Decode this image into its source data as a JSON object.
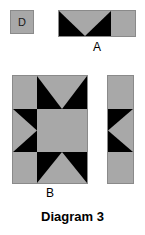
{
  "diagram": {
    "caption": "Diagram 3",
    "background_color": "#ffffff",
    "fabric_gray": "#a8a8a8",
    "fabric_black": "#000000",
    "outline_color": "#8a8a8a"
  },
  "pieces": {
    "d": {
      "label": "D",
      "shape": "square",
      "description": "plain gray square patch",
      "x": 10,
      "y": 10,
      "width": 24,
      "height": 24
    },
    "a": {
      "label": "A",
      "shape": "horizontal-strip",
      "description": "flying-geese unit pointing down joined to a plain gray square",
      "x": 58,
      "y": 10,
      "width": 78,
      "height": 27,
      "units": [
        {
          "name": "flying-geese-down",
          "triangle_direction": "down",
          "ground": "black",
          "triangle": "gray"
        },
        {
          "name": "plain-square",
          "fill": "gray"
        }
      ]
    },
    "b": {
      "label": "B",
      "shape": "star-block",
      "description": "three by three star block with gray corners, gray center and four flying-geese units pointing inward",
      "x": 12,
      "y": 75,
      "width": 76,
      "height": 109,
      "grid": [
        [
          "gray-square",
          "flying-geese-down",
          "gray-square"
        ],
        [
          "flying-geese-right",
          "gray-square-center",
          "black-square"
        ],
        [
          "gray-square",
          "flying-geese-up",
          "gray-square"
        ]
      ]
    },
    "c": {
      "label": "",
      "shape": "vertical-strip",
      "description": "gray square, flying-geese unit pointing left, gray square",
      "x": 107,
      "y": 75,
      "width": 27,
      "height": 109,
      "units": [
        {
          "name": "plain-square",
          "fill": "gray"
        },
        {
          "name": "flying-geese-left",
          "triangle_direction": "left",
          "ground": "black",
          "triangle": "gray"
        },
        {
          "name": "plain-square",
          "fill": "gray"
        }
      ]
    }
  },
  "labels": {
    "a": "A",
    "b": "B"
  }
}
